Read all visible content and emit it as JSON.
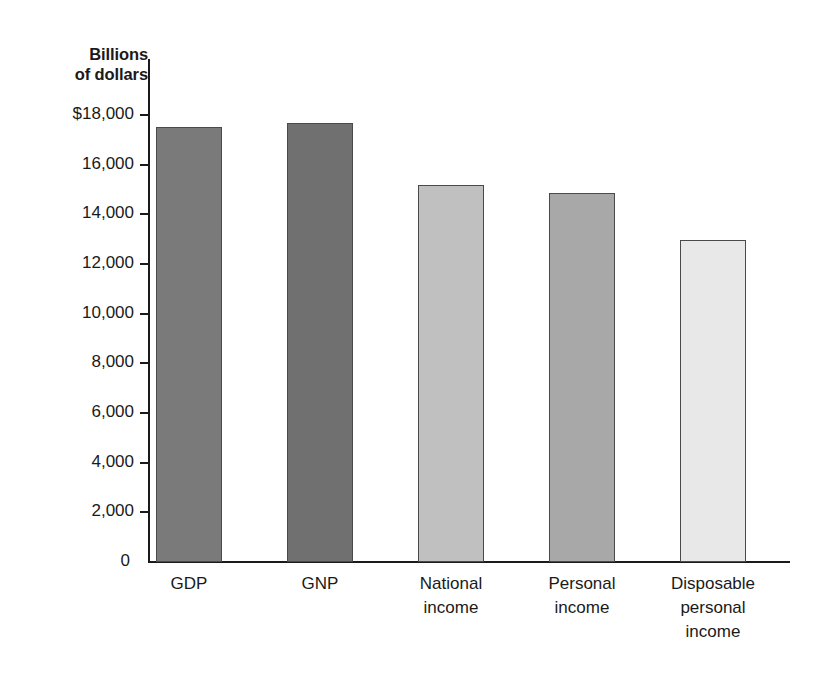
{
  "chart_data": {
    "type": "bar",
    "title": "",
    "ylabel": "Billions of dollars",
    "xlabel": "",
    "ylim": [
      0,
      18000
    ],
    "grid": false,
    "legend": "none",
    "ytick_labels": [
      "$18,000",
      "16,000",
      "14,000",
      "12,000",
      "10,000",
      "8,000",
      "6,000",
      "4,000",
      "2,000",
      "0"
    ],
    "ytick_values": [
      18000,
      16000,
      14000,
      12000,
      10000,
      8000,
      6000,
      4000,
      2000,
      0
    ],
    "categories": [
      "GDP",
      "GNP",
      "National\nincome",
      "Personal\nincome",
      "Disposable\npersonal\nincome"
    ],
    "values": [
      17500,
      17660,
      15200,
      14840,
      12980
    ],
    "bar_colors": [
      "#7a7a7a",
      "#707070",
      "#c0c0c0",
      "#a8a8a8",
      "#e8e8e8"
    ]
  },
  "axis": {
    "title_text": "Billions\nof dollars"
  }
}
